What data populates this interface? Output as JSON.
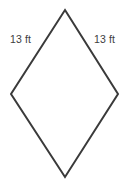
{
  "figure": {
    "type": "geometry-diagram",
    "shape_name": "rhombus",
    "background_color": "#ffffff",
    "stroke_color": "#3a3a3a",
    "stroke_width": 2,
    "fill_color": "none",
    "canvas": {
      "width": 128,
      "height": 195
    },
    "vertices": [
      {
        "name": "top",
        "x": 65,
        "y": 10
      },
      {
        "name": "right",
        "x": 118,
        "y": 94
      },
      {
        "name": "bottom",
        "x": 65,
        "y": 177
      },
      {
        "name": "left",
        "x": 11,
        "y": 94
      }
    ],
    "polygon_points": "65,10 118,94 65,177 11,94",
    "labels": [
      {
        "id": "left",
        "text": "13 ft",
        "value": "13",
        "unit": "ft",
        "edge": "top-left-side",
        "x": 10,
        "y": 34,
        "color": "#3d3d3d"
      },
      {
        "id": "right",
        "text": "13 ft",
        "value": "13",
        "unit": "ft",
        "edge": "top-right-side",
        "x": 94,
        "y": 34,
        "color": "#3d3d3d"
      }
    ]
  }
}
